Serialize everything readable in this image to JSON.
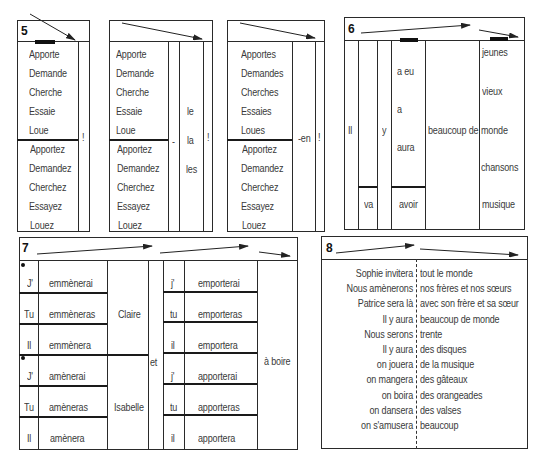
{
  "exercise5": {
    "number": "5",
    "block1": {
      "singular": [
        "Apporte",
        "Demande",
        "Cherche",
        "Essaie",
        "Loue"
      ],
      "plural": [
        "Apportez",
        "Demandez",
        "Cherchez",
        "Essayez",
        "Louez"
      ],
      "end": "!"
    },
    "block2": {
      "singular": [
        "Apporte",
        "Demande",
        "Cherche",
        "Essaie",
        "Loue"
      ],
      "plural": [
        "Apportez",
        "Demandez",
        "Cherchez",
        "Essayez",
        "Louez"
      ],
      "hyphen": "-",
      "pronouns": [
        "le",
        "la",
        "les"
      ],
      "end": "!"
    },
    "block3": {
      "singular": [
        "Apportes",
        "Demandes",
        "Cherches",
        "Essaies",
        "Loues"
      ],
      "plural": [
        "Apportez",
        "Demandez",
        "Cherchez",
        "Essayez",
        "Louez"
      ],
      "suffix": "-en",
      "end": "!"
    }
  },
  "exercise6": {
    "number": "6",
    "subject": "Il",
    "y": "y",
    "verbs": [
      "a eu",
      "a",
      "aura"
    ],
    "va": "va",
    "avoir": "avoir",
    "quantity": "beaucoup de",
    "nouns": [
      "jeunes",
      "vieux",
      "monde",
      "chansons",
      "musique"
    ]
  },
  "exercise7": {
    "number": "7",
    "left_subjects": [
      "J'",
      "Tu",
      "Il",
      "J'",
      "Tu",
      "Il"
    ],
    "left_verbs": [
      "emmènerai",
      "emmèneras",
      "emmènera",
      "amènerai",
      "amèneras",
      "amènera"
    ],
    "people": [
      "Claire",
      "Isabelle"
    ],
    "conj": "et",
    "right_subjects": [
      "j'",
      "tu",
      "il",
      "j'",
      "tu",
      "il"
    ],
    "right_verbs": [
      "emporterai",
      "emporteras",
      "emportera",
      "apporterai",
      "apporteras",
      "apportera"
    ],
    "object": "à boire"
  },
  "exercise8": {
    "number": "8",
    "rows": [
      {
        "left": "Sophie invitera",
        "right": "tout le monde"
      },
      {
        "left": "Nous amènerons",
        "right": "nos frères et nos sœurs"
      },
      {
        "left": "Patrice sera là",
        "right": "avec son frère et sa sœur"
      },
      {
        "left": "Il y aura",
        "right": "beaucoup de monde"
      },
      {
        "left": "Nous serons",
        "right": "trente"
      },
      {
        "left": "Il y aura",
        "right": "des disques"
      },
      {
        "left": "on jouera",
        "right": "de la musique"
      },
      {
        "left": "on mangera",
        "right": "des gâteaux"
      },
      {
        "left": "on boira",
        "right": "des orangeades"
      },
      {
        "left": "on dansera",
        "right": "des valses"
      },
      {
        "left": "on s'amusera",
        "right": "beaucoup"
      }
    ]
  }
}
